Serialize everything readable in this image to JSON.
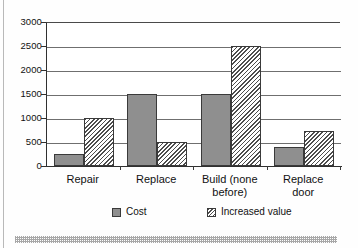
{
  "chart_data": {
    "type": "bar",
    "title": "",
    "subtitle": "",
    "xlabel": "",
    "ylabel": "",
    "ylim": [
      0,
      3000
    ],
    "yticks": [
      0,
      500,
      1000,
      1500,
      2000,
      2500,
      3000
    ],
    "ytick_labels": [
      "0",
      "500",
      "1000",
      "1500",
      "2000",
      "2500",
      "3000"
    ],
    "grid": true,
    "legend_position": "bottom",
    "categories": [
      "Repair",
      "Replace",
      "Build (none before)",
      "Replace door"
    ],
    "category_lines": [
      [
        "Repair"
      ],
      [
        "Replace"
      ],
      [
        "Build (none",
        "before)"
      ],
      [
        "Replace",
        "door"
      ]
    ],
    "series": [
      {
        "name": "Cost",
        "fill": "solid-gray",
        "color": "#8f8f8f",
        "values": [
          250,
          1500,
          1500,
          400
        ]
      },
      {
        "name": "Increased value",
        "fill": "diagonal-hatch",
        "color": "#4d4d4d",
        "values": [
          1000,
          500,
          2500,
          720
        ]
      }
    ]
  },
  "legend": {
    "items": [
      {
        "label": "Cost",
        "swatch": "solid-gray-swatch"
      },
      {
        "label": "Increased value",
        "swatch": "hatched-swatch"
      }
    ]
  },
  "artifacts": {
    "left_rule": "scan-edge-line",
    "bottom_band": "dithered-scan-band"
  }
}
